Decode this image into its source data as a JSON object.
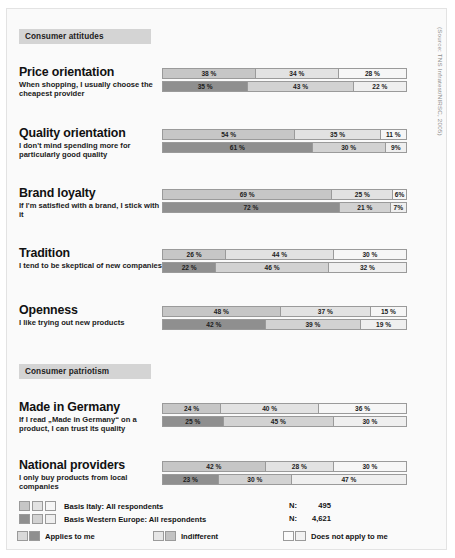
{
  "source_note": "(Source: TNS Infratest/NIRSC, 2005)",
  "sections": [
    {
      "id": "consumer-attitudes",
      "title": "Consumer attitudes"
    },
    {
      "id": "consumer-patriotism",
      "title": "Consumer patriotism"
    }
  ],
  "legend": {
    "basis_italy": "Basis Italy: All respondents",
    "basis_weurope": "Basis Western Europe: All respondents",
    "n_label": "N:",
    "n_italy": "495",
    "n_weurope": "4,621",
    "key_applies": "Applies to me",
    "key_indifferent": "Indifferent",
    "key_notapply": "Does not apply to me"
  },
  "colors": {
    "italy_applies": "#c6c6c6",
    "italy_indifferent": "#e2e2e2",
    "italy_notapply": "#f6f6f6",
    "weurope_applies": "#8f8f8f",
    "weurope_indifferent": "#d2d2d2",
    "weurope_notapply": "#efefef",
    "band": "#d4d4d4",
    "stroke": "#9a9a9a"
  },
  "chart_data": {
    "type": "bar",
    "orientation": "horizontal",
    "stacked": true,
    "units": "%",
    "xlim": [
      0,
      100
    ],
    "grid": false,
    "legend_position": "bottom",
    "series": [
      {
        "name": "Applies to me"
      },
      {
        "name": "Indifferent"
      },
      {
        "name": "Does not apply to me"
      }
    ],
    "groups_key": [
      "Basis Italy: All respondents",
      "Basis Western Europe: All respondents"
    ],
    "groups": [
      {
        "section": "Consumer attitudes",
        "title": "Price orientation",
        "description": "When shopping, I usually choose the cheapest provider",
        "italy": [
          38,
          34,
          28
        ],
        "weurope": [
          35,
          43,
          22
        ],
        "italy_labels": [
          "38 %",
          "34 %",
          "28 %"
        ],
        "weurope_labels": [
          "35 %",
          "43 %",
          "22 %"
        ]
      },
      {
        "section": "Consumer attitudes",
        "title": "Quality orientation",
        "description": "I don't mind spending more for particularly good quality",
        "italy": [
          54,
          35,
          11
        ],
        "weurope": [
          61,
          30,
          9
        ],
        "italy_labels": [
          "54 %",
          "35 %",
          "11 %"
        ],
        "weurope_labels": [
          "61 %",
          "30 %",
          "9%"
        ]
      },
      {
        "section": "Consumer attitudes",
        "title": "Brand loyalty",
        "description": "If I'm satisfied with a brand, I stick with it",
        "italy": [
          69,
          25,
          6
        ],
        "weurope": [
          72,
          21,
          7
        ],
        "italy_labels": [
          "69 %",
          "25 %",
          "6%"
        ],
        "weurope_labels": [
          "72 %",
          "21 %",
          "7%"
        ]
      },
      {
        "section": "Consumer attitudes",
        "title": "Tradition",
        "description": "I tend to be skeptical of new companies",
        "italy": [
          26,
          44,
          30
        ],
        "weurope": [
          22,
          46,
          32
        ],
        "italy_labels": [
          "26 %",
          "44 %",
          "30 %"
        ],
        "weurope_labels": [
          "22 %",
          "46 %",
          "32 %"
        ]
      },
      {
        "section": "Consumer attitudes",
        "title": "Openness",
        "description": "I like trying out new products",
        "italy": [
          48,
          37,
          15
        ],
        "weurope": [
          42,
          39,
          19
        ],
        "italy_labels": [
          "48 %",
          "37 %",
          "15 %"
        ],
        "weurope_labels": [
          "42 %",
          "39 %",
          "19 %"
        ]
      },
      {
        "section": "Consumer patriotism",
        "title": "Made in Germany",
        "description": "If I read „Made in Germany“ on a product, I can trust its quality",
        "italy": [
          24,
          40,
          36
        ],
        "weurope": [
          25,
          45,
          30
        ],
        "italy_labels": [
          "24 %",
          "40 %",
          "36 %"
        ],
        "weurope_labels": [
          "25 %",
          "45 %",
          "30 %"
        ]
      },
      {
        "section": "Consumer patriotism",
        "title": "National providers",
        "description": "I only buy products from local companies",
        "italy": [
          42,
          28,
          30
        ],
        "weurope": [
          23,
          30,
          47
        ],
        "italy_labels": [
          "42 %",
          "28 %",
          "30 %"
        ],
        "weurope_labels": [
          "23 %",
          "30 %",
          "47 %"
        ]
      }
    ]
  },
  "layout": {
    "band_tops": [
      20,
      355
    ],
    "group_tops": [
      57,
      118,
      178,
      238,
      295,
      392,
      450
    ],
    "desc_tops": [
      15,
      15,
      15,
      15,
      15,
      15,
      15
    ]
  }
}
